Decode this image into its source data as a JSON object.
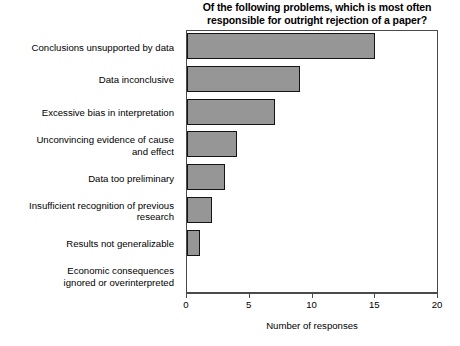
{
  "chart_data": {
    "type": "bar",
    "orientation": "horizontal",
    "title": "Of the following problems, which is most often responsible for outright rejection of a paper?",
    "title_lines": [
      "Of the following problems, which is most often",
      "responsible for outright rejection of a paper?"
    ],
    "categories": [
      "Conclusions unsupported by data",
      "Data inconclusive",
      "Excessive bias in interpretation",
      "Unconvincing evidence of cause and effect",
      "Data too preliminary",
      "Insufficient recognition of previous research",
      "Results not generalizable",
      "Economic consequences ignored or overinterpreted"
    ],
    "category_lines": [
      [
        "Conclusions unsupported by data"
      ],
      [
        "Data inconclusive"
      ],
      [
        "Excessive bias in interpretation"
      ],
      [
        "Unconvincing evidence of cause",
        "and effect"
      ],
      [
        "Data too preliminary"
      ],
      [
        "Insufficient recognition of previous",
        "research"
      ],
      [
        "Results not generalizable"
      ],
      [
        "Economic consequences",
        "ignored or overinterpreted"
      ]
    ],
    "values": [
      15,
      9,
      7,
      4,
      3,
      2,
      1,
      0
    ],
    "xlabel": "Number of responses",
    "ylabel": "",
    "xlim": [
      0,
      20
    ],
    "xticks": [
      0,
      5,
      10,
      15,
      20
    ],
    "xtick_labels": [
      "0",
      "5",
      "10",
      "15",
      "20"
    ],
    "grid": false,
    "legend": false,
    "bar_color": "#969696",
    "bar_border_color": "#141414",
    "axis_color": "#4a4a4a",
    "background": "#ffffff"
  }
}
